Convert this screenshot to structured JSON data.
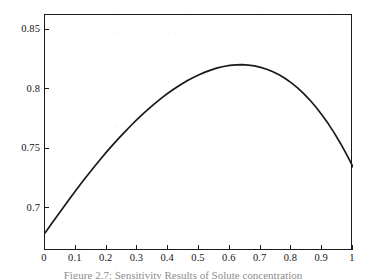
{
  "figure": {
    "caption": "Figure 2.7: Sensitivity Results of Solute concentration",
    "caption_visible": "partially clipped at image bottom edge"
  },
  "chart_data": {
    "type": "line",
    "title": "",
    "xlabel": "",
    "ylabel": "",
    "xlim": [
      0,
      1
    ],
    "ylim": [
      0.6638,
      0.8622
    ],
    "grid": false,
    "legend": null,
    "line_color": "#1a1a1a",
    "line_width": 1.6,
    "frame": "box",
    "tick_direction": "in",
    "xticks": [
      0,
      0.1,
      0.2,
      0.3,
      0.4,
      0.5,
      0.6,
      0.7,
      0.8,
      0.9,
      1
    ],
    "xticklabels": [
      "0",
      "0.1",
      "0.2",
      "0.3",
      "0.4",
      "0.5",
      "0.6",
      "0.7",
      "0.8",
      "0.9",
      "1"
    ],
    "yticks": [
      0.7,
      0.75,
      0.8,
      0.85
    ],
    "yticklabels": [
      "0.7",
      "0.75",
      "0.8",
      "0.85"
    ],
    "series": [
      {
        "name": "solute-concentration-curve",
        "x": [
          0.0,
          0.02,
          0.04,
          0.06,
          0.08,
          0.1,
          0.12,
          0.14,
          0.16,
          0.18,
          0.2,
          0.22,
          0.24,
          0.26,
          0.28,
          0.3,
          0.32,
          0.34,
          0.36,
          0.38,
          0.4,
          0.42,
          0.44,
          0.46,
          0.48,
          0.5,
          0.52,
          0.54,
          0.56,
          0.58,
          0.6,
          0.62,
          0.64,
          0.66,
          0.68,
          0.7,
          0.72,
          0.74,
          0.76,
          0.78,
          0.8,
          0.82,
          0.84,
          0.86,
          0.88,
          0.9,
          0.92,
          0.94,
          0.96,
          0.98,
          1.0
        ],
        "y": [
          0.679,
          0.6862,
          0.6934,
          0.7006,
          0.7077,
          0.7147,
          0.7215,
          0.7282,
          0.7347,
          0.741,
          0.7471,
          0.753,
          0.7587,
          0.7642,
          0.7695,
          0.7746,
          0.7795,
          0.7841,
          0.7885,
          0.7927,
          0.7966,
          0.8002,
          0.8036,
          0.8067,
          0.8095,
          0.812,
          0.8142,
          0.8161,
          0.8177,
          0.8189,
          0.8198,
          0.8203,
          0.8204,
          0.8201,
          0.8194,
          0.8182,
          0.8166,
          0.8145,
          0.8119,
          0.8088,
          0.8051,
          0.8009,
          0.7961,
          0.7907,
          0.7847,
          0.778,
          0.7707,
          0.7627,
          0.754,
          0.7446,
          0.7345
        ]
      }
    ],
    "peak": {
      "x": 0.51,
      "y": 0.846
    },
    "endpoints": {
      "left": {
        "x": 0.0,
        "y": 0.679
      },
      "right": {
        "x": 1.0,
        "y": 0.718
      }
    }
  }
}
